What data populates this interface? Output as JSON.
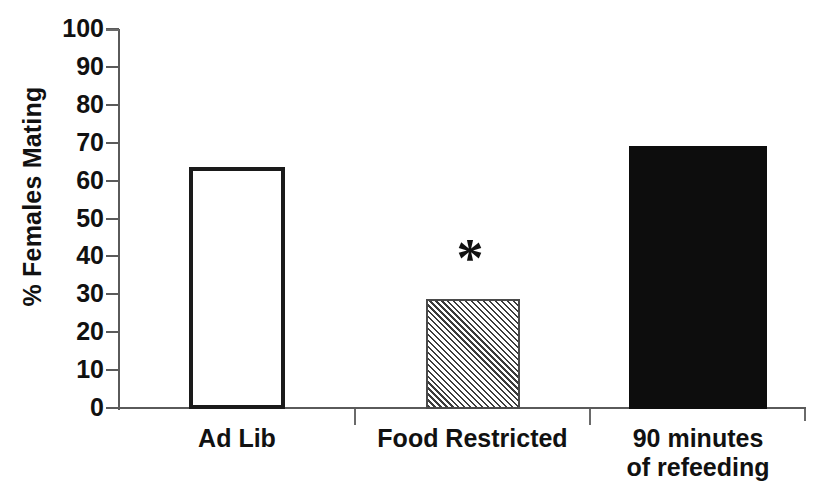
{
  "chart_data": {
    "type": "bar",
    "title": "",
    "subtitle": "",
    "xlabel": "",
    "ylabel": "% Females Mating",
    "ylim": [
      0,
      100
    ],
    "ytick_step": 10,
    "yticks": [
      100,
      90,
      80,
      70,
      60,
      50,
      40,
      30,
      20,
      10,
      0
    ],
    "ytick_labels": [
      "100",
      "90",
      "80",
      "70",
      "60",
      "50",
      "40",
      "30",
      "20",
      "10",
      "0"
    ],
    "grid": false,
    "legend": null,
    "categories": [
      "Ad Lib",
      "Food Restricted",
      "90 minutes of refeeding"
    ],
    "category_label_lines": [
      [
        "Ad Lib"
      ],
      [
        "Food Restricted"
      ],
      [
        "90 minutes",
        "of refeeding"
      ]
    ],
    "values": [
      63.5,
      28.8,
      69.0
    ],
    "bar_styles": [
      "open-outline",
      "diagonal-hatch",
      "solid-black"
    ],
    "annotations": [
      {
        "text": "*",
        "category": "Food Restricted",
        "meaning": "statistically-significant-difference",
        "value_y": 42
      }
    ],
    "colors": {
      "axis": "#5a5a5a",
      "bar_outline": "#1a1a1a",
      "bar_open_fill": "#ffffff",
      "bar_hatch_fill": "#3c3c3c",
      "bar_solid_fill": "#0d0d0d",
      "text": "#111111",
      "background": "#ffffff"
    }
  },
  "axis": {
    "y_title": "% Females Mating"
  }
}
